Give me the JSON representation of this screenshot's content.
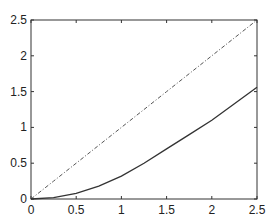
{
  "chart_data": {
    "type": "line",
    "title": "",
    "xlabel": "",
    "ylabel": "",
    "xlim": [
      0,
      2.5
    ],
    "ylim": [
      0,
      2.5
    ],
    "grid": false,
    "legend": null,
    "x_ticks": [
      "0",
      "0.5",
      "1",
      "1.5",
      "2",
      "2.5"
    ],
    "y_ticks": [
      "0",
      "0.5",
      "1",
      "1.5",
      "2",
      "2.5"
    ],
    "x": [
      0,
      0.25,
      0.5,
      0.75,
      1.0,
      1.25,
      1.5,
      1.75,
      2.0,
      2.25,
      2.5
    ],
    "series": [
      {
        "name": "dash-dot reference line",
        "style": "dashdot",
        "color": "#555555",
        "values": [
          0,
          0.25,
          0.5,
          0.75,
          1.0,
          1.25,
          1.5,
          1.75,
          2.0,
          2.25,
          2.5
        ]
      },
      {
        "name": "solid curve",
        "style": "solid",
        "color": "#333333",
        "values": [
          0,
          0.02,
          0.08,
          0.18,
          0.32,
          0.5,
          0.7,
          0.9,
          1.1,
          1.33,
          1.56
        ]
      }
    ]
  }
}
